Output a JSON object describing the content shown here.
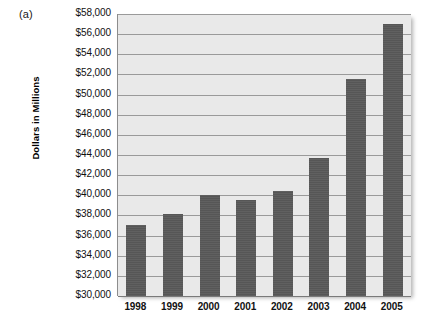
{
  "figure": {
    "panel_label": "(a)"
  },
  "chart_data": {
    "type": "bar",
    "title": "",
    "xlabel": "",
    "ylabel": "Dollars in Millions",
    "categories": [
      "1998",
      "1999",
      "2000",
      "2001",
      "2002",
      "2003",
      "2004",
      "2005"
    ],
    "values": [
      37100,
      38100,
      40000,
      39500,
      40400,
      43700,
      51500,
      57000
    ],
    "ylim": [
      30000,
      58000
    ],
    "ytick_step": 2000,
    "ytick_labels": [
      "$58,000",
      "$56,000",
      "$54,000",
      "$52,000",
      "$50,000",
      "$48,000",
      "$46,000",
      "$44,000",
      "$42,000",
      "$40,000",
      "$38,000",
      "$36,000",
      "$34,000",
      "$32,000",
      "$30,000"
    ],
    "ytick_values": [
      58000,
      56000,
      54000,
      52000,
      50000,
      48000,
      46000,
      44000,
      42000,
      40000,
      38000,
      36000,
      34000,
      32000,
      30000
    ],
    "grid": true,
    "legend": null,
    "colors": {
      "bar": "#595959",
      "plot_background": "#e9e9e9",
      "gridline": "#9a9a9a",
      "text": "#111111"
    }
  }
}
